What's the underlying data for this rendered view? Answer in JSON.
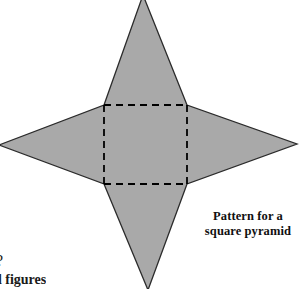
{
  "page": {
    "background_color": "#ffffff",
    "width": 301,
    "height": 289
  },
  "figure": {
    "name": "net-of-square-pyramid",
    "fill_color": "#a9a9a9",
    "outline_color": "#2b2b2b",
    "dash_color": "#000000",
    "outline_width": 1.3,
    "dash_width": 1.8,
    "dash_pattern": "7 5",
    "square": {
      "left": 104,
      "top": 105,
      "right": 187,
      "bottom": 184
    },
    "apex_top": {
      "x": 143,
      "y": -5
    },
    "apex_bottom": {
      "x": 148,
      "y": 290
    },
    "apex_left": {
      "x": -1,
      "y": 145
    },
    "apex_right": {
      "x": 297,
      "y": 144
    },
    "star_outline_points": "143,-5 187,105 297,144 187,184 148,290 104,184 -1,145 104,105",
    "triangle_top_points": "104,105 187,105 143,-5",
    "triangle_right_points": "187,105 187,184 297,144",
    "triangle_bottom_points": "104,184 187,184 148,290",
    "triangle_left_points": "104,105 104,184 -1,145"
  },
  "caption": {
    "line1": "Pattern for a",
    "line2": "square pyramid"
  },
  "fragments": {
    "question_mark": "?",
    "figures_text": "d figures"
  }
}
